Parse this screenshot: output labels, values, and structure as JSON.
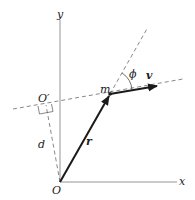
{
  "labels": {
    "y_axis": "y",
    "x_axis": "x",
    "origin": "O",
    "origin_prime": "O′",
    "position_vector": "r",
    "velocity_vector": "v",
    "mass": "m",
    "angle": "ϕ",
    "distance": "d"
  },
  "colors": {
    "axis": "#888888",
    "vector": "#1a1a1a",
    "dashed": "#555555",
    "text": "#222222"
  }
}
